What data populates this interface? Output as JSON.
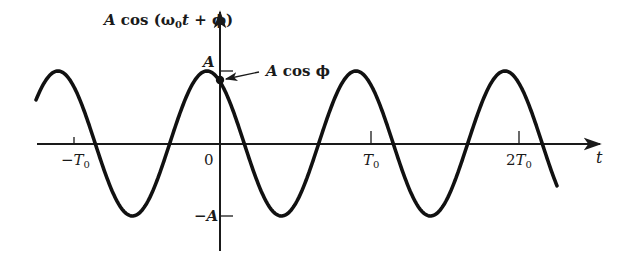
{
  "figure": {
    "y_axis_label": {
      "prefix": "A",
      "fn": " cos (",
      "omega": "ω",
      "omega_sub": "0",
      "t": "t",
      "rest": " + ϕ)"
    },
    "x_axis_label": "t",
    "y_ticks": {
      "pos": "A",
      "neg": "−A"
    },
    "x_ticks": {
      "neg_T0": {
        "sign": "−",
        "T": "T",
        "sub": "0"
      },
      "zero": "0",
      "T0": {
        "T": "T",
        "sub": "0"
      },
      "two_T0": {
        "coef": "2",
        "T": "T",
        "sub": "0"
      }
    },
    "annotation": {
      "A": "A",
      "rest": " cos ϕ"
    },
    "colors": {
      "ink": "#1a1a1a",
      "background": "#ffffff"
    }
  },
  "chart_data": {
    "type": "line",
    "title": "",
    "xlabel": "t",
    "ylabel": "A cos (ω0 t + ϕ)",
    "function": "A cos(ω0 t + ϕ)",
    "amplitude_label": "A",
    "period_label": "T0",
    "phase_rad_estimate": 0.55,
    "x_ticks": [
      "−T0",
      "0",
      "T0",
      "2T0"
    ],
    "y_ticks": [
      "A",
      "−A"
    ],
    "x_range_periods": [
      -1.25,
      2.25
    ],
    "annotation": "A cos ϕ (value at t = 0)",
    "grid": false,
    "legend": null
  }
}
